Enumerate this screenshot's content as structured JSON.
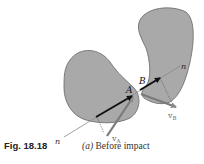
{
  "figure": {
    "number_label": "Fig. 18.18",
    "caption_letter": "(a)",
    "caption_text": "Before impact"
  },
  "diagram": {
    "bodies": [
      {
        "name": "A",
        "fill": "#a9a9a9"
      },
      {
        "name": "B",
        "fill": "#a9a9a9"
      }
    ],
    "labels": {
      "point_a": "A",
      "point_b": "B",
      "line_n_upper": "n",
      "line_n_lower": "n",
      "velocity_a_main": "v",
      "velocity_a_sub": "A",
      "velocity_b_main": "v",
      "velocity_b_sub": "B"
    },
    "colors": {
      "line_of_impact": "#8a8a8a",
      "momentum_arrow": "#111111",
      "velocity_arrow": "#7a7a7a",
      "outline": "#666666"
    }
  }
}
